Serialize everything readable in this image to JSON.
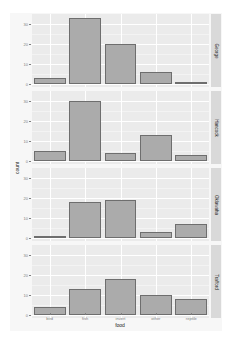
{
  "chart_data": {
    "type": "bar",
    "title": "",
    "xlabel": "food",
    "ylabel": "count",
    "categories": [
      "bird",
      "fish",
      "invert",
      "other",
      "reptile"
    ],
    "ylim": [
      0,
      34
    ],
    "yticks": [
      0,
      10,
      20,
      30
    ],
    "grid": true,
    "legend": "none",
    "facet_strip_position": "right",
    "series": [
      {
        "name": "George",
        "values": [
          3,
          33,
          20,
          6,
          1
        ]
      },
      {
        "name": "Hancock",
        "values": [
          5,
          30,
          4,
          13,
          3
        ]
      },
      {
        "name": "Oklawaha",
        "values": [
          1,
          18,
          19,
          3,
          7
        ]
      },
      {
        "name": "Trafford",
        "values": [
          4,
          13,
          18,
          10,
          8
        ]
      }
    ],
    "colors": {
      "bar_fill": "#ababab",
      "bar_outline": "#6e6e6e",
      "panel_bg": "#ebebeb",
      "strip_bg": "#d9d9d9"
    }
  },
  "axis": {
    "xlabel": "food",
    "ylabel": "count",
    "xticks": [
      "bird",
      "fish",
      "invert",
      "other",
      "reptile"
    ],
    "yticks": [
      "0",
      "10",
      "20",
      "30"
    ]
  },
  "facets": [
    "George",
    "Hancock",
    "Oklawaha",
    "Trafford"
  ]
}
